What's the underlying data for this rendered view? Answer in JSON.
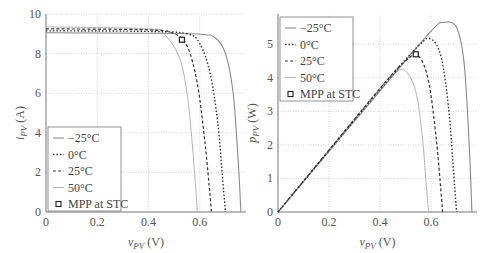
{
  "chart_data": [
    {
      "type": "line",
      "title": "",
      "xlabel": "v_PV (V)",
      "ylabel": "i_PV (A)",
      "xlim": [
        0,
        0.78
      ],
      "ylim": [
        0,
        10
      ],
      "xticks": [
        "0",
        "0.2",
        "0.4",
        "0.6"
      ],
      "yticks": [
        "0",
        "2",
        "4",
        "6",
        "8",
        "10"
      ],
      "grid": true,
      "legend_position": "lower left",
      "series": [
        {
          "name": "−25°C",
          "style": "solid",
          "x": [
            0,
            0.4,
            0.6,
            0.66,
            0.7,
            0.73,
            0.75,
            0.76
          ],
          "y": [
            9.05,
            9.03,
            8.98,
            8.8,
            8.0,
            6.0,
            2.5,
            0
          ]
        },
        {
          "name": "0°C",
          "style": "dotted",
          "x": [
            0,
            0.4,
            0.55,
            0.6,
            0.64,
            0.67,
            0.69,
            0.7
          ],
          "y": [
            9.15,
            9.12,
            9.0,
            8.5,
            7.0,
            4.5,
            1.5,
            0
          ]
        },
        {
          "name": "25°C",
          "style": "dashed",
          "x": [
            0,
            0.4,
            0.5,
            0.55,
            0.59,
            0.62,
            0.64,
            0.645
          ],
          "y": [
            9.25,
            9.2,
            9.0,
            8.4,
            6.5,
            3.5,
            0.8,
            0
          ]
        },
        {
          "name": "50°C",
          "style": "solid-light",
          "x": [
            0,
            0.4,
            0.46,
            0.52,
            0.55,
            0.57,
            0.585,
            0.59
          ],
          "y": [
            9.35,
            9.25,
            9.0,
            7.8,
            6.0,
            3.5,
            1.0,
            0
          ]
        }
      ],
      "markers": [
        {
          "name": "MPP at STC",
          "x": 0.53,
          "y": 8.7
        }
      ]
    },
    {
      "type": "line",
      "title": "",
      "xlabel": "v_PV (V)",
      "ylabel": "p_PV (W)",
      "xlim": [
        0,
        0.78
      ],
      "ylim": [
        0,
        5.9
      ],
      "xticks": [
        "0",
        "0.2",
        "0.4",
        "0.6"
      ],
      "yticks": [
        "0",
        "1",
        "2",
        "3",
        "4",
        "5"
      ],
      "grid": true,
      "legend_position": "upper left",
      "series": [
        {
          "name": "−25°C",
          "style": "solid",
          "x": [
            0,
            0.4,
            0.6,
            0.65,
            0.7,
            0.73,
            0.75,
            0.76
          ],
          "y": [
            0,
            3.61,
            5.39,
            5.65,
            5.5,
            4.4,
            1.9,
            0
          ]
        },
        {
          "name": "0°C",
          "style": "dotted",
          "x": [
            0,
            0.4,
            0.55,
            0.6,
            0.64,
            0.67,
            0.69,
            0.7
          ],
          "y": [
            0,
            3.65,
            4.95,
            5.15,
            4.6,
            3.0,
            1.0,
            0
          ]
        },
        {
          "name": "25°C",
          "style": "dashed",
          "x": [
            0,
            0.4,
            0.5,
            0.55,
            0.59,
            0.62,
            0.64,
            0.645
          ],
          "y": [
            0,
            3.68,
            4.5,
            4.65,
            3.9,
            2.2,
            0.5,
            0
          ]
        },
        {
          "name": "50°C",
          "style": "solid-light",
          "x": [
            0,
            0.4,
            0.46,
            0.5,
            0.54,
            0.565,
            0.58,
            0.59
          ],
          "y": [
            0,
            3.7,
            4.15,
            4.2,
            3.6,
            2.3,
            0.9,
            0
          ]
        }
      ],
      "markers": [
        {
          "name": "MPP at STC",
          "x": 0.54,
          "y": 4.7
        }
      ]
    }
  ],
  "legend": {
    "items": [
      "−25°C",
      "0°C",
      "25°C",
      "50°C",
      "MPP at STC"
    ]
  },
  "axes": {
    "left": {
      "ylabel_main": "i",
      "ylabel_sub": "PV",
      "ylabel_unit": " (A)",
      "xlabel_main": "v",
      "xlabel_sub": "PV",
      "xlabel_unit": " (V)"
    },
    "right": {
      "ylabel_main": "p",
      "ylabel_sub": "PV",
      "ylabel_unit": " (W)",
      "xlabel_main": "v",
      "xlabel_sub": "PV",
      "xlabel_unit": " (V)"
    }
  }
}
